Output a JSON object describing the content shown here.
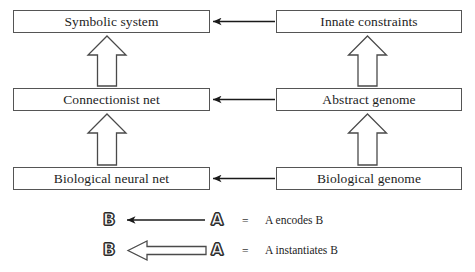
{
  "diagram": {
    "background_color": "#ffffff",
    "stroke_color": "#555555",
    "text_color": "#1d1d1d",
    "nodes": [
      {
        "id": "symbolic-system",
        "label": "Symbolic system",
        "column": "left",
        "row": "top"
      },
      {
        "id": "innate-constraints",
        "label": "Innate constraints",
        "column": "right",
        "row": "top"
      },
      {
        "id": "connectionist-net",
        "label": "Connectionist net",
        "column": "left",
        "row": "middle"
      },
      {
        "id": "abstract-genome",
        "label": "Abstract genome",
        "column": "right",
        "row": "middle"
      },
      {
        "id": "biological-neural-net",
        "label": "Biological neural net",
        "column": "left",
        "row": "bottom"
      },
      {
        "id": "biological-genome",
        "label": "Biological genome",
        "column": "right",
        "row": "bottom"
      }
    ],
    "edges": [
      {
        "id": "encode-top",
        "kind": "encodes",
        "from": "innate-constraints",
        "to": "symbolic-system",
        "direction": "left"
      },
      {
        "id": "encode-middle",
        "kind": "encodes",
        "from": "abstract-genome",
        "to": "connectionist-net",
        "direction": "left"
      },
      {
        "id": "encode-bottom",
        "kind": "encodes",
        "from": "biological-genome",
        "to": "biological-neural-net",
        "direction": "left"
      },
      {
        "id": "inst-left-lower",
        "kind": "instantiates",
        "from": "biological-neural-net",
        "to": "connectionist-net",
        "direction": "up"
      },
      {
        "id": "inst-left-upper",
        "kind": "instantiates",
        "from": "connectionist-net",
        "to": "symbolic-system",
        "direction": "up"
      },
      {
        "id": "inst-right-lower",
        "kind": "instantiates",
        "from": "biological-genome",
        "to": "abstract-genome",
        "direction": "up"
      },
      {
        "id": "inst-right-upper",
        "kind": "instantiates",
        "from": "abstract-genome",
        "to": "innate-constraints",
        "direction": "up"
      }
    ]
  },
  "legend": {
    "rows": [
      {
        "id": "encodes",
        "target_letter": "B",
        "source_letter": "A",
        "equals": "=",
        "meaning": "A encodes B",
        "arrow_style": "thin-line"
      },
      {
        "id": "instantiates",
        "target_letter": "B",
        "source_letter": "A",
        "equals": "=",
        "meaning": "A instantiates B",
        "arrow_style": "hollow-block"
      }
    ]
  }
}
